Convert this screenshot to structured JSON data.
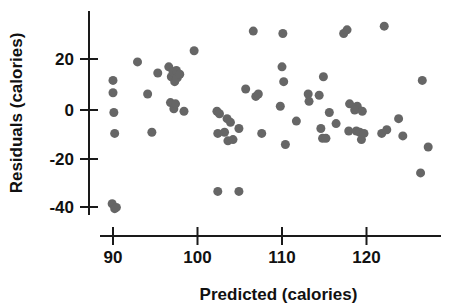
{
  "chart_data": {
    "type": "scatter",
    "title": "",
    "xlabel": "Predicted (calories)",
    "ylabel": "Residuals (calories)",
    "xlim": [
      87.5,
      128.5
    ],
    "ylim": [
      -44,
      36
    ],
    "xticks": [
      90,
      100,
      110,
      120
    ],
    "xticklabels": [
      "90",
      "100",
      "110",
      "120"
    ],
    "yticks": [
      20,
      0,
      -20,
      -40
    ],
    "yticklabels": [
      "20",
      "0",
      "-20",
      "-40"
    ],
    "grid": false,
    "legend": null,
    "marker": {
      "shape": "circle",
      "color": "#666666",
      "size_px": 9
    },
    "series": [
      {
        "name": "residuals",
        "points": [
          [
            90.0,
            12.0
          ],
          [
            90.0,
            7.0
          ],
          [
            90.1,
            -1.0
          ],
          [
            90.2,
            -9.5
          ],
          [
            89.9,
            -38.0
          ],
          [
            90.2,
            -40.0
          ],
          [
            90.4,
            -39.5
          ],
          [
            92.9,
            19.5
          ],
          [
            94.1,
            6.5
          ],
          [
            94.6,
            -9.0
          ],
          [
            95.3,
            15.0
          ],
          [
            96.6,
            17.5
          ],
          [
            96.9,
            13.5
          ],
          [
            97.1,
            15.5
          ],
          [
            97.3,
            11.5
          ],
          [
            97.5,
            16.0
          ],
          [
            97.6,
            13.0
          ],
          [
            96.8,
            3.0
          ],
          [
            97.2,
            0.5
          ],
          [
            97.4,
            2.5
          ],
          [
            97.9,
            14.5
          ],
          [
            98.4,
            -0.5
          ],
          [
            99.6,
            24.0
          ],
          [
            102.3,
            -0.5
          ],
          [
            102.6,
            -1.5
          ],
          [
            102.4,
            -9.5
          ],
          [
            103.2,
            -9.0
          ],
          [
            103.5,
            -3.5
          ],
          [
            103.9,
            -5.0
          ],
          [
            103.6,
            -12.5
          ],
          [
            104.2,
            -12.0
          ],
          [
            104.9,
            -7.5
          ],
          [
            102.4,
            -33.0
          ],
          [
            104.9,
            -33.0
          ],
          [
            105.7,
            8.5
          ],
          [
            106.6,
            32.0
          ],
          [
            106.9,
            5.5
          ],
          [
            107.2,
            6.5
          ],
          [
            107.6,
            -9.5
          ],
          [
            110.0,
            17.5
          ],
          [
            110.2,
            11.5
          ],
          [
            109.8,
            1.5
          ],
          [
            110.4,
            -14.0
          ],
          [
            110.1,
            31.0
          ],
          [
            111.7,
            -4.5
          ],
          [
            113.1,
            6.5
          ],
          [
            113.2,
            3.5
          ],
          [
            114.4,
            6.0
          ],
          [
            114.9,
            13.5
          ],
          [
            114.6,
            -7.5
          ],
          [
            114.8,
            -11.5
          ],
          [
            115.2,
            -11.5
          ],
          [
            115.6,
            -1.0
          ],
          [
            116.4,
            -5.5
          ],
          [
            117.3,
            31.0
          ],
          [
            117.7,
            32.5
          ],
          [
            118.0,
            2.5
          ],
          [
            117.9,
            -8.5
          ],
          [
            118.9,
            1.5
          ],
          [
            118.6,
            0.0
          ],
          [
            118.8,
            -8.5
          ],
          [
            119.2,
            -9.0
          ],
          [
            119.5,
            -0.5
          ],
          [
            119.4,
            -12.0
          ],
          [
            119.7,
            -9.5
          ],
          [
            122.1,
            34.0
          ],
          [
            121.8,
            -9.5
          ],
          [
            122.4,
            -8.0
          ],
          [
            123.8,
            -3.5
          ],
          [
            124.3,
            -10.5
          ],
          [
            126.6,
            12.0
          ],
          [
            126.4,
            -25.5
          ],
          [
            127.3,
            -15.0
          ]
        ]
      }
    ]
  },
  "axes": {
    "x_axis_name": "x-axis",
    "y_axis_name": "y-axis"
  }
}
